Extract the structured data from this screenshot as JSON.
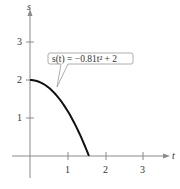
{
  "chart_data": {
    "type": "line",
    "title": "",
    "xlabel": "t",
    "ylabel": "s",
    "x_ticks": [
      "1",
      "2",
      "3"
    ],
    "y_ticks": [
      "1",
      "2",
      "3"
    ],
    "xlim": [
      -0.5,
      3.8
    ],
    "ylim": [
      -0.6,
      3.8
    ],
    "grid": false,
    "legend": null,
    "annotation": "s(t) = −0.81t² + 2",
    "series": [
      {
        "name": "s(t) = -0.81t^2 + 2",
        "x": [
          0,
          0.25,
          0.5,
          0.75,
          1.0,
          1.25,
          1.5,
          1.571
        ],
        "y": [
          2.0,
          1.949,
          1.798,
          1.544,
          1.19,
          0.734,
          0.178,
          0.0
        ]
      }
    ]
  },
  "colors": {
    "axis": "#8a8a8a",
    "curve": "#111111",
    "callout_border": "#9a9a9a",
    "text": "#333333"
  }
}
